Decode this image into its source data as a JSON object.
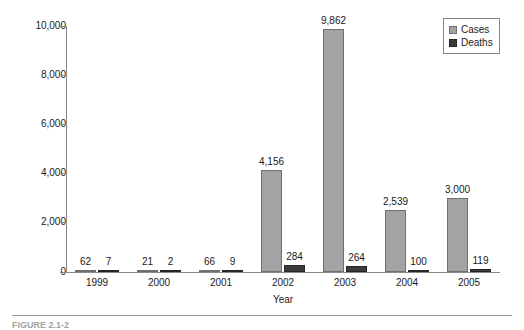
{
  "chart_data": {
    "type": "bar",
    "title": "",
    "xlabel": "Year",
    "ylabel": "",
    "categories": [
      "1999",
      "2000",
      "2001",
      "2002",
      "2003",
      "2004",
      "2005"
    ],
    "series": [
      {
        "name": "Cases",
        "color": "#a3a3a3",
        "values": [
          62,
          21,
          66,
          4156,
          9862,
          2539,
          3000
        ],
        "labels": [
          "62",
          "21",
          "66",
          "4,156",
          "9,862",
          "2,539",
          "3,000"
        ]
      },
      {
        "name": "Deaths",
        "color": "#3b3b3b",
        "values": [
          7,
          2,
          9,
          284,
          264,
          100,
          119
        ],
        "labels": [
          "7",
          "2",
          "9",
          "284",
          "264",
          "100",
          "119"
        ]
      }
    ],
    "ylim": [
      0,
      10000
    ],
    "yticks": [
      0,
      2000,
      4000,
      6000,
      8000,
      10000
    ],
    "ytick_labels": [
      "0",
      "2,000",
      "4,000",
      "6,000",
      "8,000",
      "10,000"
    ],
    "grid": false,
    "legend_position": "top-right"
  },
  "axis": {
    "x_title": "Year"
  },
  "legend": {
    "items": [
      {
        "label": "Cases"
      },
      {
        "label": "Deaths"
      }
    ]
  },
  "footer": {
    "caption": "FIGURE 2.1-2"
  }
}
